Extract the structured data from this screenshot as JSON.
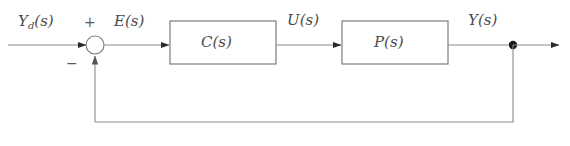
{
  "diagram": {
    "type": "control-block-diagram",
    "background_color": "#ffffff",
    "line_color": "#8c8c8c",
    "text_color": "#4a4a4a",
    "signals": {
      "reference": {
        "base": "Y",
        "subscript": "d",
        "arg": "(s)",
        "full": "Y_d(s)"
      },
      "error": {
        "base": "E",
        "subscript": "",
        "arg": "(s)",
        "full": "E(s)"
      },
      "control": {
        "base": "U",
        "subscript": "",
        "arg": "(s)",
        "full": "U(s)"
      },
      "output": {
        "base": "Y",
        "subscript": "",
        "arg": "(s)",
        "full": "Y(s)"
      }
    },
    "summing_junction": {
      "positive_sign": "+",
      "negative_sign": "−"
    },
    "blocks": [
      {
        "id": "controller",
        "label": "C(s)"
      },
      {
        "id": "plant",
        "label": "P(s)"
      }
    ]
  }
}
